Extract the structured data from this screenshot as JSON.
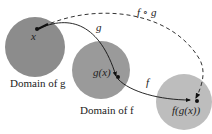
{
  "diagram": {
    "domains": [
      {
        "label": "Domain of g",
        "point_label": "x",
        "color": "#8c8c8c"
      },
      {
        "label": "Domain of f",
        "point_label": "g(x)",
        "color": "#999999"
      },
      {
        "label": "",
        "point_label": "f(g(x))",
        "color": "#bdbdbd"
      }
    ],
    "arrows": [
      {
        "label": "g",
        "from": "x",
        "to": "g(x)",
        "style": "solid"
      },
      {
        "label": "f",
        "from": "g(x)",
        "to": "f(g(x))",
        "style": "solid"
      },
      {
        "label": "f ∘ g",
        "from": "x",
        "to": "f(g(x))",
        "style": "dashed"
      }
    ]
  }
}
